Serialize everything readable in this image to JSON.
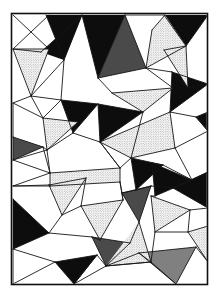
{
  "artwork": {
    "title": "Abstract Triangular Tessellation",
    "medium": "pen-and-ink line drawing",
    "canvas": {
      "width": 220,
      "height": 297,
      "background": "#ffffff"
    },
    "frame": {
      "x": 11.5,
      "y": 13.5,
      "width": 196,
      "height": 271,
      "stroke": "#101010",
      "stroke_width": 1.6
    },
    "palette": {
      "white": "#ffffff",
      "black": "#0d0d0d",
      "dark_gray": "#4a4a4a",
      "mid_gray": "#808080",
      "line": "#151515",
      "stipple_light": "#d8d8d8",
      "stipple_mid": "#a8a8a8"
    },
    "line_style": {
      "stroke": "#151515",
      "stroke_width": 0.9
    },
    "texture_names": [
      "stipple-light-pattern",
      "stipple-mid-pattern"
    ]
  },
  "shapes": {
    "filled": [
      {
        "name": "black-wedge-top-left",
        "fill": "black",
        "points": "46,15 82,15 64,60"
      },
      {
        "name": "black-wedge-upper-left-spur",
        "fill": "black",
        "points": "82,15 64,60 41,52"
      },
      {
        "name": "black-triangle-top-center",
        "fill": "black",
        "points": "82,15 125,15 98,78"
      },
      {
        "name": "dark-triangle-upper-mid",
        "fill": "dark",
        "points": "98,78 125,15 146,68"
      },
      {
        "name": "black-triangle-top-right",
        "fill": "black",
        "points": "164,15 208,15 186,46"
      },
      {
        "name": "black-triangle-center-right",
        "fill": "black",
        "points": "172,72 208,84 170,112"
      },
      {
        "name": "black-triangle-center-left",
        "fill": "black",
        "points": "61,100 98,104 73,133"
      },
      {
        "name": "black-triangle-core",
        "fill": "black",
        "points": "98,104 143,112 100,142"
      },
      {
        "name": "dark-triangle-left-edge",
        "fill": "dark",
        "points": "13,137 43,147 13,160"
      },
      {
        "name": "black-triangle-left-lower",
        "fill": "black",
        "points": "13,199 49,233 13,249"
      },
      {
        "name": "black-triangle-bottom-left",
        "fill": "black",
        "points": "55,262 97,255 74,284"
      },
      {
        "name": "black-chevron-right-upper",
        "fill": "black",
        "points": "152,163 192,180 155,196"
      },
      {
        "name": "black-chevron-right-lower",
        "fill": "black",
        "points": "173,188 208,172 208,208"
      },
      {
        "name": "black-triangle-mid-right",
        "fill": "black",
        "points": "131,158 163,165 136,190"
      },
      {
        "name": "dark-triangle-mid-right-low",
        "fill": "dark",
        "points": "122,193 151,186 139,222"
      },
      {
        "name": "mid-triangle-bottom-right",
        "fill": "mid",
        "points": "139,253 196,247 176,284"
      },
      {
        "name": "dark-triangle-lower-center",
        "fill": "dark",
        "points": "92,237 130,243 106,266"
      },
      {
        "name": "black-sliver-right-edge",
        "fill": "black",
        "points": "196,117 208,112 208,131"
      }
    ],
    "stippled": [
      {
        "name": "stipple-triangle-upper-left",
        "texture": "light",
        "points": "14,49 49,49 31,96"
      },
      {
        "name": "stipple-triangle-top-right",
        "texture": "light",
        "points": "146,68 186,46 165,15 152,30"
      },
      {
        "name": "stipple-triangle-right-upper",
        "texture": "light",
        "points": "164,50 186,46 188,88"
      },
      {
        "name": "stipple-band-center",
        "texture": "light",
        "points": "112,93 173,88 143,112"
      },
      {
        "name": "stipple-triangle-left-mid",
        "texture": "light",
        "points": "43,118 78,122 47,150"
      },
      {
        "name": "stipple-wedge-center-long",
        "texture": "light",
        "points": "100,142 170,112 175,148 131,158"
      },
      {
        "name": "stipple-triangle-left-lower",
        "texture": "light",
        "points": "49,185 86,178 62,215"
      },
      {
        "name": "stipple-band-mid-left",
        "texture": "light",
        "points": "50,173 120,168 120,182 50,186"
      },
      {
        "name": "stipple-triangle-center-low",
        "texture": "light",
        "points": "81,206 123,200 100,240"
      },
      {
        "name": "stipple-triangle-bottom-mid",
        "texture": "light",
        "points": "106,266 139,222 151,262"
      },
      {
        "name": "stipple-triangle-bottom-right",
        "texture": "light",
        "points": "151,196 190,210 155,232"
      },
      {
        "name": "stipple-triangle-far-right",
        "texture": "light",
        "points": "188,232 208,226 208,262"
      }
    ],
    "edges": [
      "11.5,13.5 207.5,13.5",
      "207.5,13.5 207.5,284.5",
      "207.5,284.5 11.5,284.5",
      "11.5,284.5 11.5,13.5",
      "13,49 49,49",
      "13,49 31,96",
      "49,49 31,96",
      "13,15 49,49",
      "49,15 13,49",
      "46,15 64,60",
      "82,15 64,60",
      "82,15 41,52",
      "41,52 13,49",
      "64,60 31,96",
      "31,96 61,100",
      "64,60 61,100",
      "82,15 98,78",
      "125,15 98,78",
      "125,15 146,68",
      "98,78 146,68",
      "125,15 165,15",
      "164,15 186,46",
      "208,15 186,46",
      "165,15 152,30",
      "152,30 146,68",
      "186,46 146,68",
      "164,50 188,88",
      "186,46 188,88",
      "164,50 186,46",
      "98,78 112,93",
      "146,68 173,88",
      "112,93 173,88",
      "112,93 143,112",
      "173,88 143,112",
      "146,68 172,72",
      "172,72 208,84",
      "208,84 170,112",
      "172,72 170,112",
      "188,88 172,72",
      "188,88 208,84",
      "61,100 98,104",
      "98,104 73,133",
      "61,100 73,133",
      "98,104 143,112",
      "143,112 100,142",
      "98,104 100,142",
      "73,133 100,142",
      "31,96 13,103",
      "13,103 43,118",
      "31,96 43,118",
      "61,100 43,118",
      "13,137 43,147",
      "43,147 13,160",
      "13,137 13,160",
      "43,118 78,122",
      "78,122 47,150",
      "43,118 47,150",
      "43,147 47,150",
      "78,122 73,133",
      "47,150 73,133",
      "13,160 47,150",
      "100,142 170,112",
      "170,112 175,148",
      "175,148 131,158",
      "100,142 131,158",
      "196,117 208,112",
      "208,112 208,131",
      "196,117 208,131",
      "170,112 196,117",
      "175,148 208,131",
      "175,148 192,180",
      "47,150 50,173",
      "50,173 120,168",
      "120,168 120,182",
      "120,182 50,186",
      "50,186 50,173",
      "13,160 50,173",
      "13,186 50,173",
      "13,186 50,186",
      "100,142 120,168",
      "131,158 120,168",
      "131,158 163,165",
      "163,165 136,190",
      "131,158 136,190",
      "152,163 192,180",
      "192,180 155,196",
      "152,163 155,196",
      "173,188 208,172",
      "208,172 208,208",
      "173,188 208,208",
      "192,180 208,172",
      "163,165 192,180",
      "136,190 151,186",
      "151,186 173,188",
      "122,193 151,186",
      "151,186 139,222",
      "122,193 139,222",
      "120,182 122,193",
      "50,186 49,185",
      "49,185 86,178",
      "86,178 62,215",
      "49,185 62,215",
      "13,186 49,185",
      "13,199 49,233",
      "49,233 13,249",
      "13,199 13,249",
      "62,215 49,233",
      "86,178 81,206",
      "81,206 123,200",
      "123,200 100,240",
      "81,206 100,240",
      "62,215 81,206",
      "120,182 123,200",
      "122,193 123,200",
      "49,233 92,237",
      "92,237 130,243",
      "130,243 106,266",
      "92,237 106,266",
      "100,240 92,237",
      "139,222 130,243",
      "139,222 151,262",
      "151,262 106,266",
      "13,249 55,262",
      "55,262 97,255",
      "97,255 74,284",
      "55,262 74,284",
      "13,249 13,284",
      "13,284 55,262",
      "74,284 97,255",
      "97,255 106,266",
      "106,266 151,262",
      "139,253 196,247",
      "196,247 176,284",
      "139,253 176,284",
      "151,262 139,253",
      "106,266 139,253",
      "151,196 190,210",
      "190,210 155,232",
      "151,196 155,232",
      "155,196 151,196",
      "190,210 208,208",
      "188,232 208,226",
      "208,226 208,262",
      "188,232 208,262",
      "155,232 188,232",
      "190,210 188,232",
      "155,232 151,262",
      "151,262 176,284",
      "196,247 208,262",
      "74,284 106,266",
      "136,190 122,193",
      "163,165 152,163",
      "208,131 196,117",
      "143,112 131,158",
      "120,168 100,142",
      "13,103 13,137",
      "43,147 50,173"
    ]
  }
}
